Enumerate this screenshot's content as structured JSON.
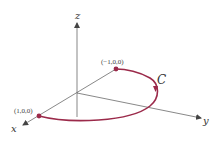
{
  "figure": {
    "axes": {
      "x_label": "x",
      "y_label": "y",
      "z_label": "z"
    },
    "points": [
      {
        "label": "(1,0,0)"
      },
      {
        "label": "(−1,0,0)"
      }
    ],
    "curve": {
      "label": "C",
      "color": "#9b2a4a"
    },
    "colors": {
      "axis": "#555555",
      "curve": "#9b2a4a"
    }
  }
}
